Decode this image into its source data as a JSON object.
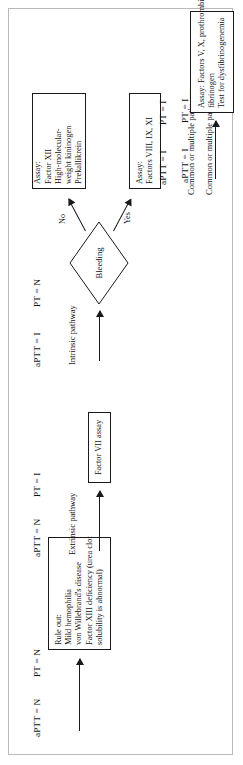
{
  "figure": {
    "orientation": "rotated-90-ccw",
    "ink_color": "#111111",
    "frame_color": "#b9b9b9"
  },
  "branches": [
    {
      "id": "normal",
      "heading_aptt": "aPTT = N",
      "heading_pt": "PT = N",
      "pathway_label": "",
      "box": {
        "lines": [
          "Rule out:",
          "Mild hemophilia",
          "von Willebrand's disease",
          "Factor XIII deficiency (urea clot",
          "   solubility is abnormal)"
        ]
      }
    },
    {
      "id": "extrinsic",
      "heading_aptt": "aPTT = N",
      "heading_pt": "PT = I",
      "pathway_label": "Extrinsic pathway",
      "box": {
        "lines": [
          "Factor VII assay"
        ]
      }
    },
    {
      "id": "intrinsic",
      "heading_aptt": "aPTT = I",
      "heading_pt": "PT = N",
      "pathway_label": "Intrinsic pathway",
      "decision": "Bleeding",
      "edge_yes": "Yes",
      "edge_no": "No",
      "box_yes": {
        "lines": [
          "Assay:",
          "Factors VIII, IX, XI"
        ]
      },
      "box_no": {
        "lines": [
          "Assay:",
          "Factor XII",
          "High-molecular-",
          "   weight kininogen",
          "Prekallikrein"
        ]
      }
    },
    {
      "id": "common",
      "heading_aptt": "aPTT = I",
      "heading_pt": "PT = I",
      "pathway_label": "Common or multiple pathways",
      "box": {
        "lines": [
          "Assay: Factors V, X, prothrombin,",
          "   fibrinogen",
          "Test for dysfibrinogenemia"
        ]
      }
    }
  ]
}
